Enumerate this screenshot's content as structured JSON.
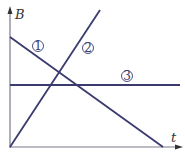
{
  "axes": {
    "y_label": "B",
    "x_label": "t"
  },
  "lines": [
    {
      "id": "line-1",
      "label": "①",
      "label_number": "1",
      "description": "decreasing line"
    },
    {
      "id": "line-2",
      "label": "②",
      "label_number": "2",
      "description": "increasing line through origin"
    },
    {
      "id": "line-3",
      "label": "③",
      "label_number": "3",
      "description": "horizontal constant line"
    }
  ],
  "colors": {
    "line": "#3a3a6e",
    "axis": "#7a7a8a"
  }
}
